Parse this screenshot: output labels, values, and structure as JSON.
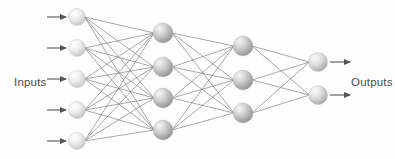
{
  "diagram": {
    "type": "neural-network",
    "title": "",
    "background_color": "#fefefe",
    "labels": {
      "inputs": "Inputs",
      "outputs": "Outputs"
    },
    "edge_color": "#6f6f6f",
    "edge_width": 0.6,
    "arrow_color": "#555555",
    "layers": [
      {
        "id": "input-layer",
        "name": "input",
        "count": 5,
        "x": 77,
        "radius": 8.5,
        "node_fill_light": "#ffffff",
        "node_fill_dark": "#c9c9c9",
        "nodes_y": [
          17,
          48,
          79,
          110,
          141
        ]
      },
      {
        "id": "hidden-layer-1",
        "name": "hidden-1",
        "count": 4,
        "x": 163,
        "radius": 10,
        "node_fill_light": "#f2f2f2",
        "node_fill_dark": "#9a9a9a",
        "nodes_y": [
          33,
          67,
          98,
          130
        ]
      },
      {
        "id": "hidden-layer-2",
        "name": "hidden-2",
        "count": 3,
        "x": 243,
        "radius": 10,
        "node_fill_light": "#f2f2f2",
        "node_fill_dark": "#9a9a9a",
        "nodes_y": [
          46,
          80,
          113
        ]
      },
      {
        "id": "output-layer",
        "name": "output",
        "count": 2,
        "x": 318,
        "radius": 9.5,
        "node_fill_light": "#f7f7f7",
        "node_fill_dark": "#b2b2b2",
        "nodes_y": [
          62,
          95
        ]
      }
    ],
    "input_arrows": {
      "x_start": 47,
      "x_end": 66,
      "ys": [
        17,
        48,
        79,
        110,
        141
      ]
    },
    "output_arrows": {
      "x_start": 330,
      "x_end": 350,
      "ys": [
        62,
        95
      ]
    },
    "inputs_label_pos": {
      "x": 14,
      "y": 83
    },
    "outputs_label_pos": {
      "x": 351,
      "y": 83
    }
  }
}
